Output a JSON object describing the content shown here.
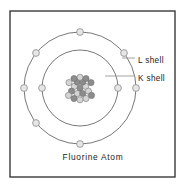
{
  "figure": {
    "caption": "Fluorine Atom",
    "frame": {
      "x": 10,
      "y": 11,
      "width": 165,
      "height": 166,
      "stroke": "#3a3a3a"
    },
    "background_color": "#ffffff"
  },
  "labels": [
    {
      "id": "l-shell",
      "text": "L shell",
      "x": 138,
      "y": 61,
      "leader_x1": 122,
      "leader_x2": 135,
      "leader_y": 58
    },
    {
      "id": "k-shell",
      "text": "K shell",
      "x": 138,
      "y": 79,
      "leader_x1": 105,
      "leader_x2": 135,
      "leader_y": 76
    }
  ],
  "chart_data": {
    "type": "diagram",
    "title": "Fluorine Atom",
    "model": "Bohr atomic model",
    "element": "Fluorine",
    "center": {
      "x": 80,
      "y": 88
    },
    "shells": [
      {
        "name": "K shell",
        "label": "K shell",
        "index": 1,
        "radius": 38,
        "electron_count": 2,
        "stroke": "#555555",
        "electrons": [
          {
            "angle_deg": 180,
            "x": 42,
            "y": 88
          },
          {
            "angle_deg": 0,
            "x": 118,
            "y": 88
          }
        ]
      },
      {
        "name": "L shell",
        "label": "L shell",
        "index": 2,
        "radius": 56,
        "electron_count": 7,
        "stroke": "#555555",
        "electrons": [
          {
            "angle_deg": 90,
            "x": 80,
            "y": 32
          },
          {
            "angle_deg": 141,
            "x": 36,
            "y": 53
          },
          {
            "angle_deg": 39,
            "x": 124,
            "y": 53
          },
          {
            "angle_deg": 180,
            "x": 24,
            "y": 88
          },
          {
            "angle_deg": 0,
            "x": 136,
            "y": 88
          },
          {
            "angle_deg": 219,
            "x": 36,
            "y": 123
          },
          {
            "angle_deg": 270,
            "x": 80,
            "y": 144
          }
        ]
      }
    ],
    "nucleus": {
      "radius": 15,
      "nucleon_radius": 3.1,
      "proton_count": 9,
      "neutron_count": 10,
      "nucleon_total": 19,
      "proton_color": "#8c8c8c",
      "neutron_color": "#d4d4d4",
      "nucleon_stroke": "#6e6e6e",
      "nucleons": [
        {
          "x": 80.0,
          "y": 88.0,
          "type": "proton"
        },
        {
          "x": 74.3,
          "y": 86.4,
          "type": "neutron"
        },
        {
          "x": 85.7,
          "y": 86.4,
          "type": "neutron"
        },
        {
          "x": 77.2,
          "y": 82.0,
          "type": "proton"
        },
        {
          "x": 82.8,
          "y": 82.0,
          "type": "proton"
        },
        {
          "x": 77.2,
          "y": 93.5,
          "type": "neutron"
        },
        {
          "x": 82.8,
          "y": 93.5,
          "type": "proton"
        },
        {
          "x": 71.5,
          "y": 91.2,
          "type": "proton"
        },
        {
          "x": 88.5,
          "y": 91.2,
          "type": "neutron"
        },
        {
          "x": 80.0,
          "y": 77.3,
          "type": "neutron"
        },
        {
          "x": 74.0,
          "y": 78.5,
          "type": "proton"
        },
        {
          "x": 86.0,
          "y": 78.5,
          "type": "proton"
        },
        {
          "x": 69.0,
          "y": 82.6,
          "type": "neutron"
        },
        {
          "x": 91.0,
          "y": 82.6,
          "type": "proton"
        },
        {
          "x": 68.5,
          "y": 95.4,
          "type": "neutron"
        },
        {
          "x": 91.5,
          "y": 95.4,
          "type": "proton"
        },
        {
          "x": 74.0,
          "y": 98.5,
          "type": "proton"
        },
        {
          "x": 86.0,
          "y": 98.5,
          "type": "neutron"
        },
        {
          "x": 80.0,
          "y": 99.8,
          "type": "neutron"
        }
      ]
    },
    "electron_style": {
      "radius": 3.4,
      "fill": "#e6e6e6",
      "stroke": "#8a8a8a"
    },
    "legend_position": "right",
    "grid": false
  }
}
